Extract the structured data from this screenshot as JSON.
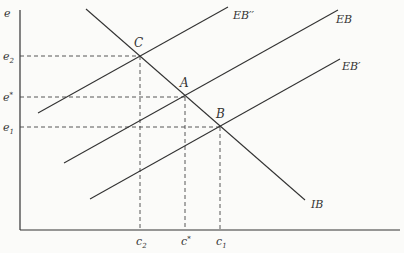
{
  "diagram": {
    "type": "economics-line-diagram",
    "axes": {
      "y_label": "e",
      "x_label": ""
    },
    "curves": [
      {
        "id": "IB",
        "label": "IB",
        "slope": "downward"
      },
      {
        "id": "EB",
        "label": "EB",
        "slope": "upward"
      },
      {
        "id": "EB_prime",
        "label": "EB′",
        "slope": "upward"
      },
      {
        "id": "EB_double_prime",
        "label": "EB′′",
        "slope": "upward"
      }
    ],
    "points": [
      {
        "id": "A",
        "label": "A",
        "on": [
          "IB",
          "EB"
        ],
        "x_tick": "c*",
        "y_tick": "e*"
      },
      {
        "id": "B",
        "label": "B",
        "on": [
          "IB",
          "EB′"
        ],
        "x_tick": "c1",
        "y_tick": "e1"
      },
      {
        "id": "C",
        "label": "C",
        "on": [
          "IB",
          "EB′′"
        ],
        "x_tick": "c2",
        "y_tick": "e2"
      }
    ],
    "y_ticks": [
      {
        "base": "e",
        "sup": "*",
        "sub": ""
      },
      {
        "base": "e",
        "sup": "",
        "sub": "1"
      },
      {
        "base": "e",
        "sup": "",
        "sub": "2"
      }
    ],
    "x_ticks": [
      {
        "base": "c",
        "sup": "",
        "sub": "2"
      },
      {
        "base": "c",
        "sup": "*",
        "sub": ""
      },
      {
        "base": "c",
        "sup": "",
        "sub": "1"
      }
    ]
  }
}
